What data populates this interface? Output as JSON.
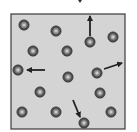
{
  "diagram": {
    "type": "gas-particles-in-container",
    "container": {
      "x": 11,
      "y": 14,
      "width": 114,
      "height": 115,
      "fill": "#d4d4d4",
      "stroke": "#3a3a3a"
    },
    "colors": {
      "particle_dark": "#3c3c3c",
      "particle_mid": "#8a8a8a",
      "particle_light": "#e6e6e6",
      "arrow": "#222222"
    },
    "particles": [
      {
        "id": "p1",
        "cx": 24,
        "cy": 25
      },
      {
        "id": "p2",
        "cx": 56,
        "cy": 31
      },
      {
        "id": "p3",
        "cx": 90,
        "cy": 42
      },
      {
        "id": "p4",
        "cx": 113,
        "cy": 37
      },
      {
        "id": "p5",
        "cx": 33,
        "cy": 51
      },
      {
        "id": "p6",
        "cx": 67,
        "cy": 51
      },
      {
        "id": "p7",
        "cx": 18,
        "cy": 70
      },
      {
        "id": "p8",
        "cx": 68,
        "cy": 77
      },
      {
        "id": "p9",
        "cx": 97,
        "cy": 73
      },
      {
        "id": "p10",
        "cx": 40,
        "cy": 92
      },
      {
        "id": "p11",
        "cx": 100,
        "cy": 93
      },
      {
        "id": "p12",
        "cx": 22,
        "cy": 112
      },
      {
        "id": "p13",
        "cx": 56,
        "cy": 112
      },
      {
        "id": "p14",
        "cx": 84,
        "cy": 123
      },
      {
        "id": "p15",
        "cx": 111,
        "cy": 112
      }
    ],
    "velocity_arrows": [
      {
        "id": "a1",
        "particle": "p3",
        "direction": "up",
        "x1": 90,
        "y1": 36,
        "x2": 90,
        "y2": 16
      },
      {
        "id": "a2",
        "particle": "p7",
        "direction": "left",
        "x1": 45,
        "y1": 70,
        "x2": 27,
        "y2": 70
      },
      {
        "id": "a3",
        "particle": "p9",
        "direction": "up-right",
        "x1": 104,
        "y1": 69,
        "x2": 122,
        "y2": 63
      },
      {
        "id": "a4",
        "particle": "p14",
        "direction": "down-right",
        "x1": 73,
        "y1": 100,
        "x2": 80,
        "y2": 117
      }
    ]
  }
}
